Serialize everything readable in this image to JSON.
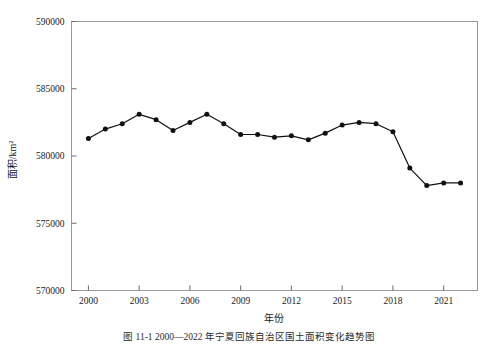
{
  "caption": "图 11-1  2000—2022 年宁夏回族自治区国土面积变化趋势图",
  "chart_data": {
    "type": "line",
    "title": "",
    "xlabel": "年份",
    "ylabel": "面积/km²",
    "xlim": [
      1999.0,
      2023.0
    ],
    "ylim": [
      570000,
      590000
    ],
    "ytick_labels": [
      "570000",
      "575000",
      "580000",
      "585000",
      "590000"
    ],
    "yticks": [
      570000,
      575000,
      580000,
      585000,
      590000
    ],
    "xtick_labels": [
      "2000",
      "2003",
      "2006",
      "2009",
      "2012",
      "2015",
      "2018",
      "2021"
    ],
    "xticks": [
      2000,
      2003,
      2006,
      2009,
      2012,
      2015,
      2018,
      2021
    ],
    "grid": false,
    "legend": "none",
    "marker": "filled-circle",
    "line_color": "#111111",
    "x": [
      2000,
      2001,
      2002,
      2003,
      2004,
      2005,
      2006,
      2007,
      2008,
      2009,
      2010,
      2011,
      2012,
      2013,
      2014,
      2015,
      2016,
      2017,
      2018,
      2019,
      2020,
      2021,
      2022
    ],
    "values": [
      581300,
      582000,
      582400,
      583100,
      582700,
      581900,
      582500,
      583100,
      582400,
      581600,
      581600,
      581400,
      581500,
      581200,
      581700,
      582300,
      582500,
      582400,
      581800,
      579100,
      577800,
      578000,
      578000
    ]
  }
}
